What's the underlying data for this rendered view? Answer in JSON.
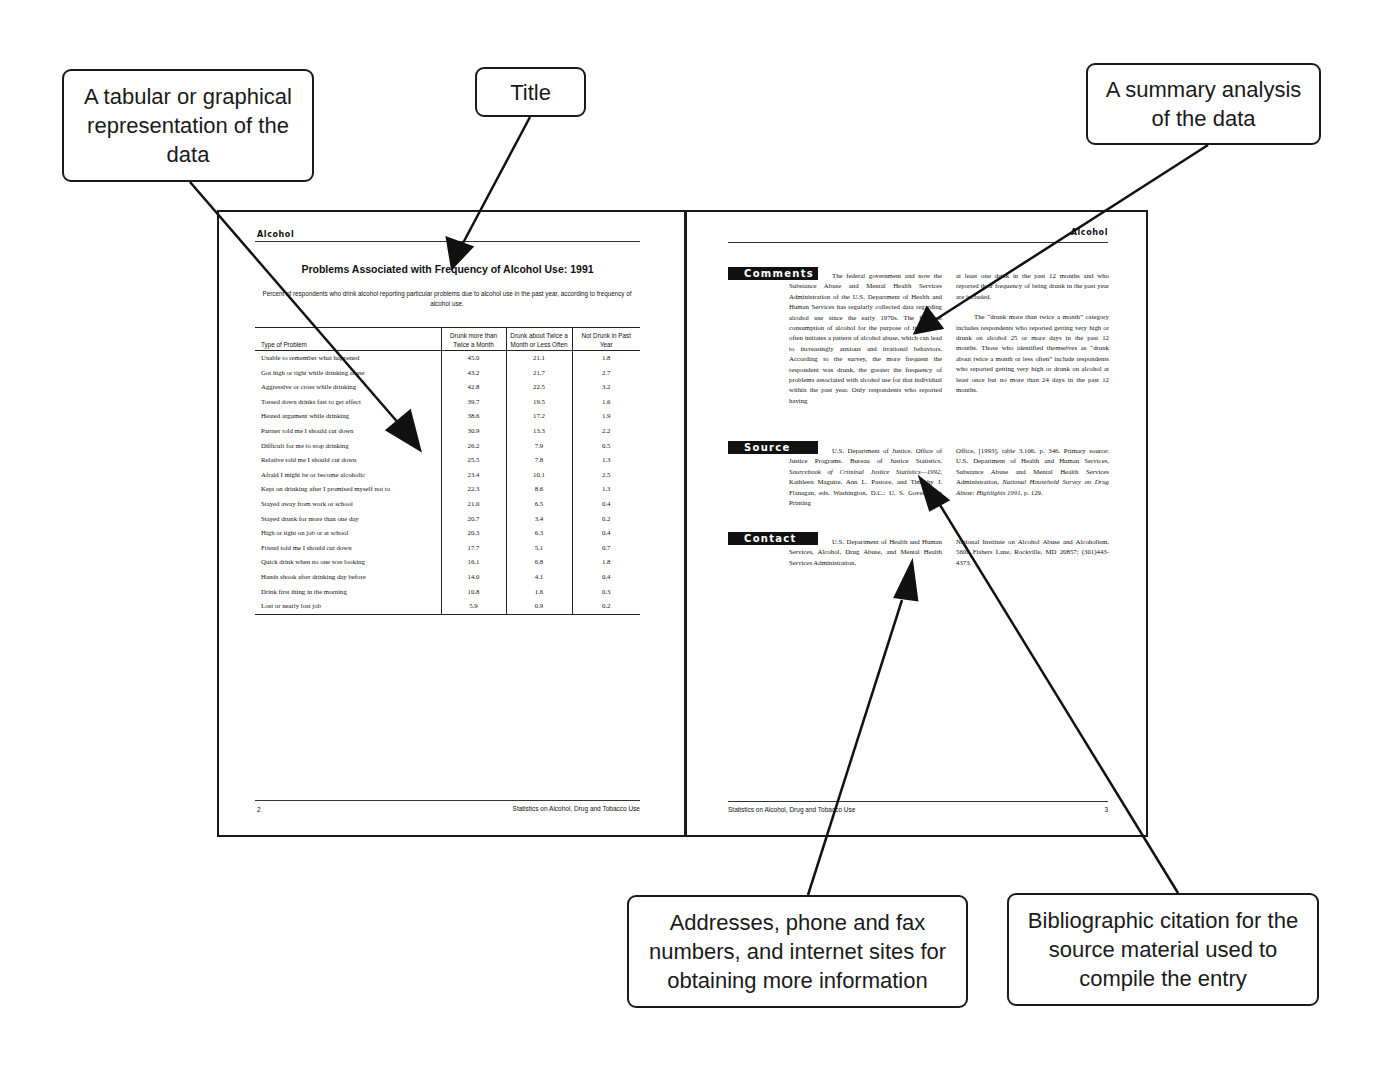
{
  "callouts": {
    "table": "A tabular or graphical representation of the data",
    "title": "Title",
    "summary": "A summary analysis of the data",
    "contact": "Addresses, phone and fax numbers, and internet sites for obtaining more information",
    "citation": "Bibliographic citation for the source material used to compile the entry"
  },
  "left_page": {
    "running_head": "Alcohol",
    "title": "Problems Associated with Frequency of Alcohol Use: 1991",
    "subtitle": "Percent of respondents who drink alcohol reporting particular problems due to alcohol use in the past year, according to frequency of alcohol use.",
    "table": {
      "headers": [
        "Type of Problem",
        "Drunk more than Twice a Month",
        "Drunk about Twice a Month or Less Often",
        "Not Drunk in Past Year"
      ],
      "rows": [
        {
          "problem": "Unable to remember what happened",
          "v1": "45.0",
          "v2": "21.1",
          "v3": "1.8"
        },
        {
          "problem": "Got high or tight while drinking alone",
          "v1": "43.2",
          "v2": "21.7",
          "v3": "2.7"
        },
        {
          "problem": "Aggressive or cross while drinking",
          "v1": "42.8",
          "v2": "22.5",
          "v3": "3.2"
        },
        {
          "problem": "Tossed down drinks fast to get effect",
          "v1": "39.7",
          "v2": "19.5",
          "v3": "1.6"
        },
        {
          "problem": "Heated argument while drinking",
          "v1": "38.6",
          "v2": "17.2",
          "v3": "1.9"
        },
        {
          "problem": "Partner told me I should cut down",
          "v1": "30.9",
          "v2": "13.3",
          "v3": "2.2"
        },
        {
          "problem": "Difficult for me to stop drinking",
          "v1": "26.2",
          "v2": "7.9",
          "v3": "0.5"
        },
        {
          "problem": "Relative told me I should cut down",
          "v1": "25.5",
          "v2": "7.8",
          "v3": "1.3"
        },
        {
          "problem": "Afraid I might be or become alcoholic",
          "v1": "23.4",
          "v2": "10.1",
          "v3": "2.5"
        },
        {
          "problem": "Kept on drinking after I promised myself not to",
          "v1": "22.3",
          "v2": "8.6",
          "v3": "1.3"
        },
        {
          "problem": "Stayed away from work or school",
          "v1": "21.0",
          "v2": "6.5",
          "v3": "0.4"
        },
        {
          "problem": "Stayed drunk for more than one day",
          "v1": "20.7",
          "v2": "3.4",
          "v3": "0.2"
        },
        {
          "problem": "High or tight on job or at school",
          "v1": "20.3",
          "v2": "6.3",
          "v3": "0.4"
        },
        {
          "problem": "Friend told me I should cut down",
          "v1": "17.7",
          "v2": "5.1",
          "v3": "0.7"
        },
        {
          "problem": "Quick drink when no one was looking",
          "v1": "16.1",
          "v2": "6.8",
          "v3": "1.8"
        },
        {
          "problem": "Hands shook after drinking day before",
          "v1": "14.0",
          "v2": "4.1",
          "v3": "0.4"
        },
        {
          "problem": "Drink first thing in the morning",
          "v1": "10.8",
          "v2": "1.6",
          "v3": "0.3"
        },
        {
          "problem": "Lost or nearly lost job",
          "v1": "5.9",
          "v2": "0.9",
          "v3": "0.2"
        }
      ]
    },
    "footer_page": "2",
    "footer_title": "Statistics on Alcohol, Drug and Tobacco Use"
  },
  "right_page": {
    "running_head": "Alcohol",
    "comments": {
      "label": "Comments",
      "col1": "The federal government and now the Substance Abuse and Mental Health Services Administration of the U.S. Department of Health and Human Services has regularly collected data regarding alcohol use since the early 1970s. The frequent consumption of alcohol for the purpose of inebriation often initiates a pattern of alcohol abuse, which can lead to increasingly anxious and irrational behaviors. According to the survey, the more frequent the respondent was drunk, the greater the frequency of problems associated with alcohol use for that individual within the past year. Only respondents who reported having",
      "col2a": "at least one drink in the past 12 months and who reported their frequency of being drunk in the past year are included.",
      "col2b": "The “drunk more than twice a month” category includes respondents who reported getting very high or drunk on alcohol 25 or more days in the past 12 months. Those who identified themselves as “drunk about twice a month or less often” include respondents who reported getting very high or drunk on alcohol at least once but no more than 24 days in the past 12 months."
    },
    "source": {
      "label": "Source",
      "col1_a": "U.S. Department of Justice. Office of Justice Programs. Bureau of Justice Statistics. ",
      "col1_italic": "Sourcebook of Criminal Justice Statistics—1992",
      "col1_b": ", Kathleen Maguire, Ann L. Pastore, and Timothy J. Flanagan, eds. Washington, D.C.: U. S. Government Printing",
      "col2_a": "Office, [1993], table 3.106, p. 346. Primary source: U.S. Department of Health and Human Services, Substance Abuse and Mental Health Services Administration, ",
      "col2_italic": "National Household Survey on Drug Abuse: Highlights 1991",
      "col2_b": ", p. 129."
    },
    "contact": {
      "label": "Contact",
      "col1": "U.S. Department of Health and Human Services, Alcohol, Drug Abuse, and Mental Health Services Administration,",
      "col2": "National Institute on Alcohol Abuse and Alcoholism, 5600 Fishers Lane, Rockville, MD 20857; (301)443-4373."
    },
    "footer_title": "Statistics on Alcohol, Drug and Tobacco Use",
    "footer_page": "3"
  }
}
